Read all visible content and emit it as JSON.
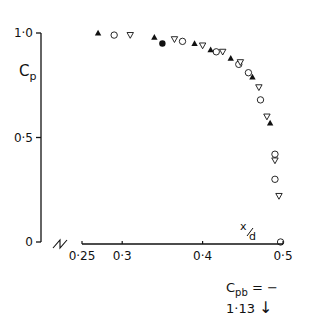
{
  "chart_data": {
    "type": "scatter",
    "title": "",
    "xlabel": "x/d",
    "ylabel": "Cp",
    "xlim": [
      0.25,
      0.5
    ],
    "ylim": [
      0,
      1.0
    ],
    "x_ticks": [
      "0·25",
      "0·3",
      "0·4",
      "0·5"
    ],
    "x_tick_values": [
      0.25,
      0.3,
      0.4,
      0.5
    ],
    "y_ticks": [
      "0",
      "0·5",
      "1·0"
    ],
    "y_tick_values": [
      0,
      0.5,
      1.0
    ],
    "grid": false,
    "axis_break": true,
    "annotation": {
      "base": "C",
      "sub": "pb",
      "text": " = − 1·13",
      "arrow": "↓"
    },
    "series": [
      {
        "name": "filled-triangle",
        "marker": "triangle-up-filled",
        "points": [
          [
            0.27,
            1.0
          ],
          [
            0.34,
            0.98
          ],
          [
            0.39,
            0.95
          ],
          [
            0.41,
            0.92
          ],
          [
            0.435,
            0.88
          ],
          [
            0.462,
            0.79
          ],
          [
            0.484,
            0.57
          ]
        ]
      },
      {
        "name": "open-circle",
        "marker": "circle-open",
        "points": [
          [
            0.29,
            0.99
          ],
          [
            0.375,
            0.96
          ],
          [
            0.417,
            0.91
          ],
          [
            0.445,
            0.85
          ],
          [
            0.457,
            0.81
          ],
          [
            0.472,
            0.68
          ],
          [
            0.49,
            0.42
          ],
          [
            0.49,
            0.3
          ],
          [
            0.497,
            0.0
          ]
        ]
      },
      {
        "name": "open-triangle-down",
        "marker": "triangle-down-open",
        "points": [
          [
            0.31,
            0.99
          ],
          [
            0.365,
            0.97
          ],
          [
            0.4,
            0.94
          ],
          [
            0.425,
            0.91
          ],
          [
            0.447,
            0.86
          ],
          [
            0.47,
            0.74
          ],
          [
            0.48,
            0.6
          ],
          [
            0.49,
            0.39
          ],
          [
            0.495,
            0.22
          ]
        ]
      },
      {
        "name": "filled-circle",
        "marker": "circle-filled",
        "points": [
          [
            0.35,
            0.95
          ]
        ]
      }
    ]
  },
  "labels": {
    "y_axis_base": "C",
    "y_axis_sub": "p",
    "x_axis_label": "x/d",
    "annotation_base": "C",
    "annotation_sub": "pb",
    "annotation_value": " = − 1·13",
    "annotation_arrow": "↓"
  }
}
